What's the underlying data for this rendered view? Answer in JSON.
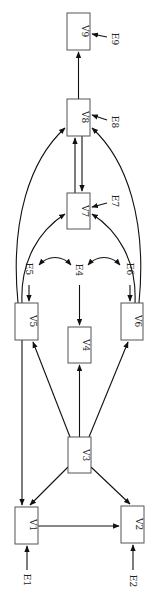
{
  "diagram": {
    "type": "directed-graph",
    "orientation": "rotated-90",
    "nodes": [
      {
        "id": "V1",
        "label": "V1"
      },
      {
        "id": "V2",
        "label": "V2"
      },
      {
        "id": "V3",
        "label": "V3"
      },
      {
        "id": "V4",
        "label": "V4"
      },
      {
        "id": "V5",
        "label": "V5"
      },
      {
        "id": "V6",
        "label": "V6"
      },
      {
        "id": "V7",
        "label": "V7"
      },
      {
        "id": "V8",
        "label": "V8"
      },
      {
        "id": "V9",
        "label": "V9"
      }
    ],
    "error_terms": [
      {
        "id": "E1",
        "label": "E1",
        "target": "V1"
      },
      {
        "id": "E2",
        "label": "E2",
        "target": "V2"
      },
      {
        "id": "E4",
        "label": "E4",
        "target": "V4"
      },
      {
        "id": "E5",
        "label": "E5",
        "target": "V5"
      },
      {
        "id": "E6",
        "label": "E6",
        "target": "V6"
      },
      {
        "id": "E7",
        "label": "E7",
        "target": "V7"
      },
      {
        "id": "E8",
        "label": "E8",
        "target": "V8"
      },
      {
        "id": "E9",
        "label": "E9",
        "target": "V9"
      }
    ],
    "edges": [
      {
        "from": "V1",
        "to": "V2"
      },
      {
        "from": "V3",
        "to": "V1"
      },
      {
        "from": "V3",
        "to": "V2"
      },
      {
        "from": "V3",
        "to": "V4"
      },
      {
        "from": "V3",
        "to": "V5"
      },
      {
        "from": "V3",
        "to": "V6"
      },
      {
        "from": "V5",
        "to": "V1"
      },
      {
        "from": "V5",
        "to": "V7"
      },
      {
        "from": "V5",
        "to": "V8"
      },
      {
        "from": "V6",
        "to": "V7"
      },
      {
        "from": "V6",
        "to": "V8"
      },
      {
        "from": "V7",
        "to": "V8"
      },
      {
        "from": "V8",
        "to": "V7"
      },
      {
        "from": "V8",
        "to": "V9"
      }
    ],
    "bidirectional": [
      {
        "a": "E5",
        "b": "E4"
      },
      {
        "a": "E4",
        "b": "E6"
      }
    ]
  }
}
